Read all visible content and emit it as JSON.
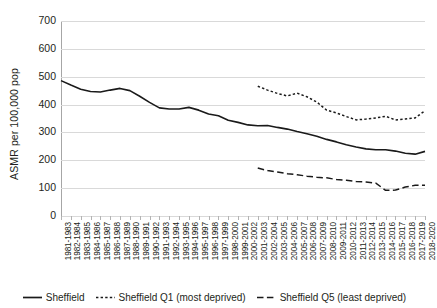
{
  "chart_data": {
    "type": "line",
    "title": "",
    "xlabel": "",
    "ylabel": "ASMR per 100,000 pop",
    "ylim": [
      0,
      700
    ],
    "ytick_values": [
      700,
      600,
      500,
      400,
      300,
      200,
      100,
      0
    ],
    "grid": true,
    "legend_position": "bottom",
    "categories": [
      "1981-1983",
      "1982-1984",
      "1983-1985",
      "1984-1986",
      "1985-1987",
      "1986-1988",
      "1987-1989",
      "1988-1990",
      "1989-1991",
      "1990-1992",
      "1991-1993",
      "1992-1994",
      "1993-1995",
      "1994-1996",
      "1995-1997",
      "1996-1998",
      "1997-1999",
      "1998-2000",
      "1999-2001",
      "2000-2002",
      "2001-2003",
      "2002-2004",
      "2003-2005",
      "2004-2006",
      "2005-2007",
      "2006-2008",
      "2007-2009",
      "2008-2010",
      "2009-2011",
      "2010-2012",
      "2011-2013",
      "2012-2014",
      "2013-2015",
      "2014-2016",
      "2015-2017",
      "2016-2018",
      "2017-2019",
      "2018-2020"
    ],
    "series": [
      {
        "name": "Sheffield",
        "style": "solid",
        "color": "#1a1a1a",
        "values": [
          486,
          470,
          455,
          447,
          445,
          452,
          458,
          450,
          430,
          408,
          388,
          384,
          384,
          390,
          380,
          366,
          360,
          344,
          336,
          327,
          324,
          325,
          318,
          312,
          303,
          295,
          286,
          275,
          266,
          256,
          248,
          241,
          238,
          238,
          233,
          225,
          222,
          232
        ]
      },
      {
        "name": "Sheffield Q1 (most deprived)",
        "style": "dotted",
        "color": "#1a1a1a",
        "values": [
          null,
          null,
          null,
          null,
          null,
          null,
          null,
          null,
          null,
          null,
          null,
          null,
          null,
          null,
          null,
          null,
          null,
          null,
          null,
          null,
          466,
          452,
          440,
          431,
          441,
          428,
          409,
          380,
          370,
          357,
          345,
          348,
          352,
          358,
          345,
          348,
          352,
          378
        ]
      },
      {
        "name": "Sheffield Q5 (least deprived)",
        "style": "dashed",
        "color": "#1a1a1a",
        "values": [
          null,
          null,
          null,
          null,
          null,
          null,
          null,
          null,
          null,
          null,
          null,
          null,
          null,
          null,
          null,
          null,
          null,
          null,
          null,
          null,
          172,
          163,
          158,
          152,
          148,
          143,
          139,
          137,
          131,
          128,
          124,
          122,
          118,
          92,
          93,
          104,
          110,
          110
        ]
      }
    ]
  },
  "legend": {
    "items": [
      {
        "label": "Sheffield",
        "dash": "solid"
      },
      {
        "label": "Sheffield Q1 (most deprived)",
        "dash": "dotted"
      },
      {
        "label": "Sheffield Q5 (least deprived)",
        "dash": "dashed"
      }
    ]
  }
}
